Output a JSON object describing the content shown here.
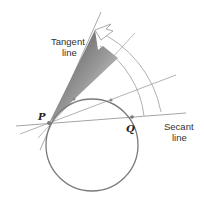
{
  "figure": {
    "labels": {
      "tangent_line_1": "Tangent",
      "tangent_line_2": "line",
      "secant_line_1": "Secant",
      "secant_line_2": "line",
      "point_p": "P",
      "point_q": "Q"
    },
    "colors": {
      "circle": "#7a7a7a",
      "lines": "#9a9a9a",
      "arcs": "#a0a0a0",
      "wedge_dark": "#555555",
      "wedge_light": "#e6e6e6",
      "points": "#666666"
    },
    "geometry": {
      "P": [
        49,
        123
      ],
      "Q": [
        132,
        117
      ],
      "circle_center": [
        95,
        145
      ],
      "circle_radius": 49
    }
  }
}
